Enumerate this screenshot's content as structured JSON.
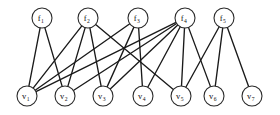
{
  "figure": {
    "type": "bipartite-graph",
    "title": "",
    "background_color": "#ffffff",
    "edge_color": "#1a1a1a",
    "node_fill": "#ffffff",
    "node_stroke": "#2a2a2a",
    "width": 280,
    "height": 115
  },
  "nodes": {
    "factors": [
      {
        "id": "f1",
        "base": "f",
        "sub": "1",
        "cx": 42,
        "cy": 18,
        "r": 10
      },
      {
        "id": "f2",
        "base": "f",
        "sub": "2",
        "cx": 88,
        "cy": 18,
        "r": 10
      },
      {
        "id": "f3",
        "base": "f",
        "sub": "3",
        "cx": 138,
        "cy": 18,
        "r": 10
      },
      {
        "id": "f4",
        "base": "f",
        "sub": "4",
        "cx": 185,
        "cy": 18,
        "r": 10
      },
      {
        "id": "f5",
        "base": "f",
        "sub": "5",
        "cx": 224,
        "cy": 18,
        "r": 10
      }
    ],
    "variables": [
      {
        "id": "v1",
        "base": "v",
        "sub": "1",
        "cx": 27,
        "cy": 96,
        "r": 10
      },
      {
        "id": "v2",
        "base": "v",
        "sub": "2",
        "cx": 65,
        "cy": 96,
        "r": 10
      },
      {
        "id": "v3",
        "base": "v",
        "sub": "3",
        "cx": 103,
        "cy": 96,
        "r": 10
      },
      {
        "id": "v4",
        "base": "v",
        "sub": "4",
        "cx": 143,
        "cy": 96,
        "r": 10
      },
      {
        "id": "v5",
        "base": "v",
        "sub": "5",
        "cx": 181,
        "cy": 96,
        "r": 10
      },
      {
        "id": "v6",
        "base": "v",
        "sub": "6",
        "cx": 214,
        "cy": 96,
        "r": 10
      },
      {
        "id": "v7",
        "base": "v",
        "sub": "7",
        "cx": 252,
        "cy": 96,
        "r": 10
      }
    ]
  },
  "edges": [
    {
      "from": "f1",
      "to": "v1"
    },
    {
      "from": "f1",
      "to": "v2"
    },
    {
      "from": "f2",
      "to": "v1"
    },
    {
      "from": "f2",
      "to": "v2"
    },
    {
      "from": "f2",
      "to": "v3"
    },
    {
      "from": "f2",
      "to": "v5"
    },
    {
      "from": "f3",
      "to": "v1"
    },
    {
      "from": "f3",
      "to": "v3"
    },
    {
      "from": "f3",
      "to": "v4"
    },
    {
      "from": "f4",
      "to": "v1"
    },
    {
      "from": "f4",
      "to": "v2"
    },
    {
      "from": "f4",
      "to": "v3"
    },
    {
      "from": "f4",
      "to": "v4"
    },
    {
      "from": "f4",
      "to": "v5"
    },
    {
      "from": "f4",
      "to": "v6"
    },
    {
      "from": "f5",
      "to": "v5"
    },
    {
      "from": "f5",
      "to": "v6"
    },
    {
      "from": "f5",
      "to": "v7"
    }
  ]
}
